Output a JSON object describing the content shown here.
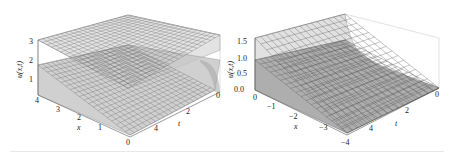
{
  "chart_data": [
    {
      "type": "surface3d",
      "title": "",
      "xlabel": "x",
      "ylabel": "t",
      "zlabel": "u(x,t)",
      "x_ticks": [
        "0",
        "1",
        "2",
        "3",
        "4"
      ],
      "t_ticks": [
        "0",
        "2",
        "4"
      ],
      "z_ticks": [
        "1",
        "2",
        "3"
      ],
      "xlim": [
        0,
        4
      ],
      "tlim": [
        0,
        5
      ],
      "zlim": [
        0,
        3
      ],
      "surfaces": [
        {
          "name": "upper surface",
          "approx_level": 3.0,
          "note": "nearly flat plane at u≈3, curling down near x=0, t=0 edge"
        },
        {
          "name": "lower surface",
          "approx_level": 1.6,
          "note": "rises from ≈0 at x=0 to ≈1.7 at x=4, steep near t=0"
        }
      ],
      "grid": true
    },
    {
      "type": "surface3d",
      "title": "",
      "xlabel": "x",
      "ylabel": "t",
      "zlabel": "u(x,t)",
      "x_ticks": [
        "0",
        "−1",
        "−2",
        "−3",
        "−4"
      ],
      "t_ticks": [
        "0",
        "2",
        "4"
      ],
      "z_ticks": [
        "0.0",
        "0.5",
        "1.0",
        "1.5"
      ],
      "xlim": [
        -4,
        0
      ],
      "tlim": [
        0,
        5
      ],
      "zlim": [
        0,
        1.6
      ],
      "surfaces": [
        {
          "name": "upper surface",
          "approx_level": 1.5,
          "note": "≈1.5 at x=0, decays exponentially to ≈0 toward x=-4 near t=0 corner"
        },
        {
          "name": "lower surface",
          "approx_level": 0.9,
          "note": "≈0.9 at x=0 decreasing to ≈0 at x=-4"
        }
      ],
      "grid": true
    }
  ],
  "panels": {
    "left": {
      "zlabel": "u(x,t)",
      "xlabel": "x",
      "tlabel": "t",
      "z_ticks": [
        "3",
        "2",
        "1"
      ],
      "x_ticks": [
        "4",
        "3",
        "2",
        "1",
        "0"
      ],
      "t_ticks": [
        "0",
        "2",
        "4"
      ]
    },
    "right": {
      "zlabel": "u(x,t)",
      "xlabel": "x",
      "tlabel": "t",
      "z_ticks": [
        "1.5",
        "1.0",
        "0.5",
        "0.0"
      ],
      "x_ticks": [
        "0",
        "−1",
        "−2",
        "−3",
        "−4"
      ],
      "t_ticks": [
        "0",
        "2",
        "4"
      ]
    }
  }
}
